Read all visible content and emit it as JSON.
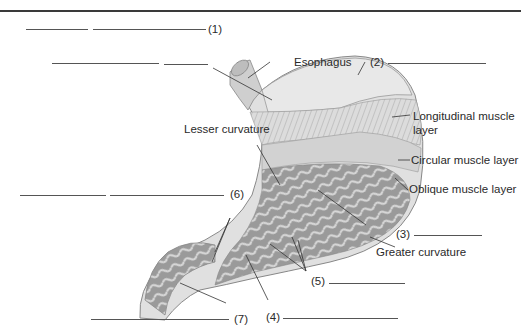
{
  "diagram": {
    "labels": {
      "esophagus": "Esophagus",
      "longitudinal_1": "Longitudinal muscle",
      "longitudinal_2": "layer",
      "circular": "Circular muscle layer",
      "oblique": "Oblique muscle layer",
      "lesser_curvature": "Lesser curvature",
      "greater_curvature": "Greater curvature"
    },
    "numbered": {
      "n1": "(1)",
      "n2": "(2)",
      "n3": "(3)",
      "n4": "(4)",
      "n5": "(5)",
      "n6": "(6)",
      "n7": "(7)"
    },
    "colors": {
      "line": "#333333",
      "stomach_light": "#e2e2e2",
      "stomach_mid": "#b8b8b8",
      "stomach_dark": "#7a7a7a"
    }
  }
}
